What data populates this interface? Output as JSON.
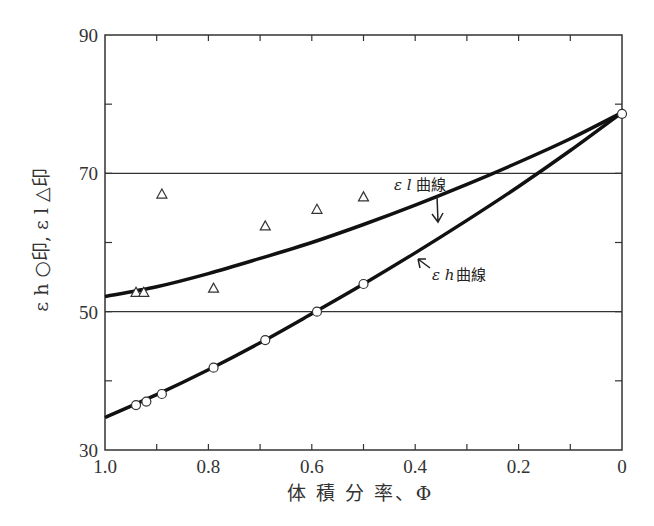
{
  "chart_data": {
    "type": "scatter",
    "title": "",
    "xlabel": "体積分率、Φ",
    "ylabel": "ε h ○印,  ε l △印",
    "xlim": [
      1.0,
      0.0
    ],
    "ylim": [
      30,
      90
    ],
    "x_reversed": true,
    "x_ticks": [
      1.0,
      0.8,
      0.6,
      0.4,
      0.2,
      0
    ],
    "x_tick_labels": [
      "1.0",
      "0.8",
      "0.6",
      "0.4",
      "0.2",
      "0"
    ],
    "y_ticks": [
      30,
      50,
      70,
      90
    ],
    "y_tick_labels": [
      "30",
      "50",
      "70",
      "90"
    ],
    "grid": {
      "horizontal_lines_at": [
        50,
        70
      ]
    },
    "series": [
      {
        "name": "ε h (○印)",
        "marker": "circle",
        "points": [
          {
            "x": 0.94,
            "y": 36.5
          },
          {
            "x": 0.92,
            "y": 37.0
          },
          {
            "x": 0.89,
            "y": 38.1
          },
          {
            "x": 0.79,
            "y": 41.9
          },
          {
            "x": 0.69,
            "y": 45.9
          },
          {
            "x": 0.59,
            "y": 50.0
          },
          {
            "x": 0.5,
            "y": 54.0
          },
          {
            "x": 0.0,
            "y": 78.6
          }
        ]
      },
      {
        "name": "ε l (△印)",
        "marker": "triangle",
        "points": [
          {
            "x": 0.94,
            "y": 52.8
          },
          {
            "x": 0.925,
            "y": 52.8
          },
          {
            "x": 0.89,
            "y": 67.0
          },
          {
            "x": 0.79,
            "y": 53.4
          },
          {
            "x": 0.69,
            "y": 62.4
          },
          {
            "x": 0.59,
            "y": 64.8
          },
          {
            "x": 0.5,
            "y": 66.6
          }
        ]
      },
      {
        "name": "ε l 曲線",
        "type": "line",
        "points": [
          {
            "x": 1.0,
            "y": 52.2
          },
          {
            "x": 0.9,
            "y": 53.6
          },
          {
            "x": 0.8,
            "y": 55.5
          },
          {
            "x": 0.7,
            "y": 57.7
          },
          {
            "x": 0.6,
            "y": 60.0
          },
          {
            "x": 0.5,
            "y": 62.6
          },
          {
            "x": 0.4,
            "y": 65.4
          },
          {
            "x": 0.3,
            "y": 68.4
          },
          {
            "x": 0.2,
            "y": 71.6
          },
          {
            "x": 0.1,
            "y": 75.0
          },
          {
            "x": 0.0,
            "y": 78.8
          }
        ]
      },
      {
        "name": "ε h 曲線",
        "type": "line",
        "points": [
          {
            "x": 1.0,
            "y": 34.7
          },
          {
            "x": 0.9,
            "y": 38.0
          },
          {
            "x": 0.8,
            "y": 41.6
          },
          {
            "x": 0.7,
            "y": 45.5
          },
          {
            "x": 0.6,
            "y": 49.7
          },
          {
            "x": 0.5,
            "y": 54.0
          },
          {
            "x": 0.4,
            "y": 58.5
          },
          {
            "x": 0.3,
            "y": 63.2
          },
          {
            "x": 0.2,
            "y": 68.1
          },
          {
            "x": 0.1,
            "y": 73.3
          },
          {
            "x": 0.0,
            "y": 78.8
          }
        ]
      }
    ],
    "annotations": [
      {
        "text_symbol": "ε l",
        "text": "曲線",
        "points_to": "ε l 曲線"
      },
      {
        "text_symbol": "ε h",
        "text": "曲線",
        "points_to": "ε h 曲線"
      }
    ]
  },
  "labels": {
    "xlabel": "体 積 分 率、Φ",
    "ylabel": "ε h ○印,   ε l △印",
    "annot_l_symbol": "ε l",
    "annot_l_text": "曲線",
    "annot_h_symbol": "ε h",
    "annot_h_text": "曲線"
  }
}
